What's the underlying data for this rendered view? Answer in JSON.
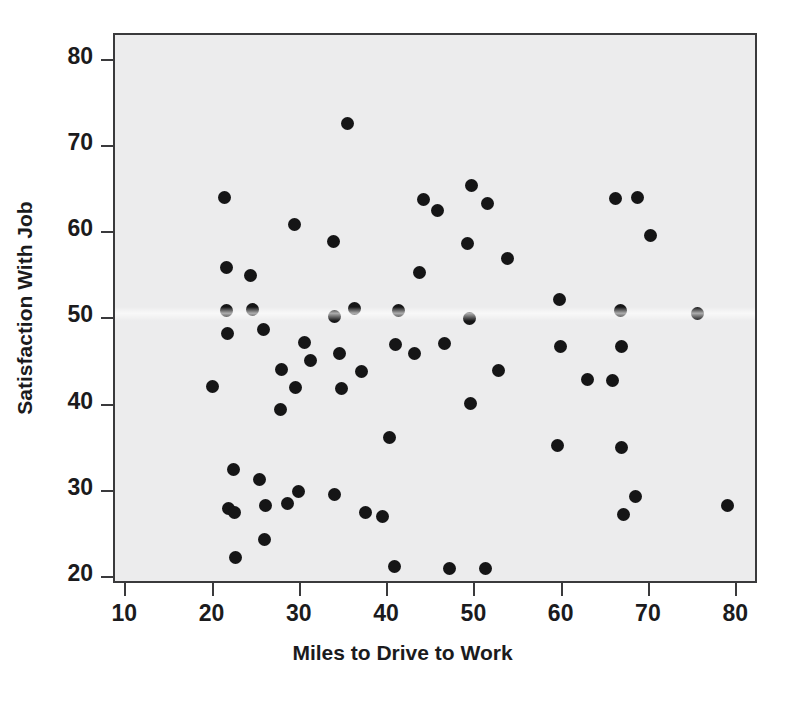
{
  "chart_data": {
    "type": "scatter",
    "title": "",
    "xlabel": "Miles to Drive to Work",
    "ylabel": "Satisfaction With Job",
    "xlim": [
      8.7,
      82.5
    ],
    "ylim": [
      19.2,
      83.0
    ],
    "xticks": [
      10,
      20,
      30,
      40,
      50,
      60,
      70,
      80
    ],
    "yticks": [
      20,
      30,
      40,
      50,
      60,
      70,
      80
    ],
    "xtick_labels": [
      "10",
      "20",
      "30",
      "40",
      "50",
      "60",
      "70",
      "80"
    ],
    "ytick_labels": [
      "20",
      "30",
      "40",
      "50",
      "60",
      "70",
      "80"
    ],
    "grid": false,
    "legend": null,
    "marker": "filled-circle",
    "marker_color": "#151516",
    "marker_size_px": 13,
    "plot_background": "#ececed",
    "frame_color": "#3a3a3c",
    "n_points": 69,
    "points": [
      {
        "x": 19.9,
        "y": 42.2
      },
      {
        "x": 21.2,
        "y": 64.1
      },
      {
        "x": 21.5,
        "y": 56.0
      },
      {
        "x": 21.5,
        "y": 51.1
      },
      {
        "x": 21.6,
        "y": 48.4
      },
      {
        "x": 21.7,
        "y": 28.1
      },
      {
        "x": 22.3,
        "y": 32.6
      },
      {
        "x": 22.4,
        "y": 27.6
      },
      {
        "x": 22.5,
        "y": 22.4
      },
      {
        "x": 24.2,
        "y": 55.1
      },
      {
        "x": 24.4,
        "y": 51.2
      },
      {
        "x": 25.3,
        "y": 31.4
      },
      {
        "x": 25.7,
        "y": 48.8
      },
      {
        "x": 25.8,
        "y": 24.5
      },
      {
        "x": 25.9,
        "y": 28.4
      },
      {
        "x": 27.7,
        "y": 39.6
      },
      {
        "x": 27.8,
        "y": 44.2
      },
      {
        "x": 28.5,
        "y": 28.6
      },
      {
        "x": 29.3,
        "y": 61.0
      },
      {
        "x": 29.4,
        "y": 42.1
      },
      {
        "x": 29.7,
        "y": 30.0
      },
      {
        "x": 30.4,
        "y": 47.3
      },
      {
        "x": 31.1,
        "y": 45.2
      },
      {
        "x": 33.7,
        "y": 59.0
      },
      {
        "x": 33.8,
        "y": 50.3
      },
      {
        "x": 33.9,
        "y": 29.7
      },
      {
        "x": 34.4,
        "y": 46.1
      },
      {
        "x": 34.6,
        "y": 42.0
      },
      {
        "x": 35.4,
        "y": 72.7
      },
      {
        "x": 36.1,
        "y": 51.3
      },
      {
        "x": 36.9,
        "y": 44.0
      },
      {
        "x": 37.4,
        "y": 27.6
      },
      {
        "x": 39.4,
        "y": 27.2
      },
      {
        "x": 40.2,
        "y": 36.3
      },
      {
        "x": 40.7,
        "y": 21.4
      },
      {
        "x": 40.9,
        "y": 47.1
      },
      {
        "x": 41.2,
        "y": 51.1
      },
      {
        "x": 43.0,
        "y": 46.0
      },
      {
        "x": 43.6,
        "y": 55.5
      },
      {
        "x": 44.0,
        "y": 63.9
      },
      {
        "x": 45.7,
        "y": 62.6
      },
      {
        "x": 46.5,
        "y": 47.2
      },
      {
        "x": 47.0,
        "y": 21.1
      },
      {
        "x": 49.1,
        "y": 58.8
      },
      {
        "x": 49.3,
        "y": 50.1
      },
      {
        "x": 49.4,
        "y": 40.2
      },
      {
        "x": 49.5,
        "y": 65.6
      },
      {
        "x": 51.2,
        "y": 21.1
      },
      {
        "x": 51.4,
        "y": 63.5
      },
      {
        "x": 52.7,
        "y": 44.1
      },
      {
        "x": 53.7,
        "y": 57.1
      },
      {
        "x": 59.4,
        "y": 35.4
      },
      {
        "x": 59.6,
        "y": 52.3
      },
      {
        "x": 59.8,
        "y": 46.9
      },
      {
        "x": 62.8,
        "y": 43.0
      },
      {
        "x": 65.7,
        "y": 42.9
      },
      {
        "x": 66.1,
        "y": 64.0
      },
      {
        "x": 66.6,
        "y": 51.0
      },
      {
        "x": 66.8,
        "y": 35.2
      },
      {
        "x": 66.8,
        "y": 46.9
      },
      {
        "x": 67.0,
        "y": 27.4
      },
      {
        "x": 68.4,
        "y": 29.5
      },
      {
        "x": 68.6,
        "y": 64.1
      },
      {
        "x": 70.1,
        "y": 59.8
      },
      {
        "x": 75.5,
        "y": 50.7
      },
      {
        "x": 78.9,
        "y": 28.4
      }
    ]
  }
}
